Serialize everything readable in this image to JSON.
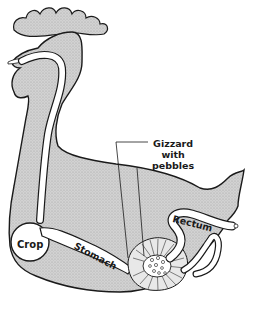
{
  "diagram": {
    "colors": {
      "body_fill": "#cfcfcf",
      "outline": "#1a1a1a",
      "tract_fill": "#ffffff",
      "background": "#ffffff"
    },
    "labels": {
      "gizzard_line1": "Gizzard",
      "gizzard_line2": "with",
      "gizzard_line3": "pebbles",
      "rectum": "Rectum",
      "crop": "Crop",
      "stomach": "Stomach"
    }
  }
}
